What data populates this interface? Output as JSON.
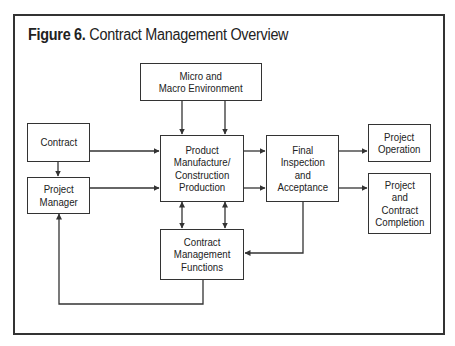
{
  "figure": {
    "label": "Figure 6.",
    "title": "Contract Management Overview"
  },
  "nodes": {
    "environment": "Micro and\nMacro Environment",
    "contract": "Contract",
    "project_manager": "Project\nManager",
    "production": "Product\nManufacture/\nConstruction\nProduction",
    "inspection": "Final\nInspection\nand\nAcceptance",
    "project_operation": "Project\nOperation",
    "completion": "Project\nand\nContract\nCompletion",
    "management_functions": "Contract\nManagement\nFunctions"
  },
  "edges": [
    {
      "from": "environment",
      "to": "production"
    },
    {
      "from": "contract",
      "to": "production"
    },
    {
      "from": "contract",
      "to": "project_manager"
    },
    {
      "from": "project_manager",
      "to": "production"
    },
    {
      "from": "production",
      "to": "inspection"
    },
    {
      "from": "production",
      "to": "management_functions",
      "bidirectional": true
    },
    {
      "from": "inspection",
      "to": "project_operation"
    },
    {
      "from": "inspection",
      "to": "completion"
    },
    {
      "from": "inspection",
      "to": "management_functions"
    },
    {
      "from": "management_functions",
      "to": "project_manager"
    }
  ]
}
